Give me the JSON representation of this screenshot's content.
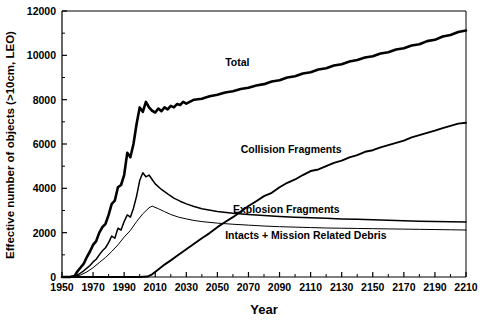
{
  "chart_data": {
    "type": "line",
    "title": "",
    "xlabel": "Year",
    "ylabel": "Effective number of objects (>10cm, LEO)",
    "xlim": [
      1950,
      2210
    ],
    "ylim": [
      0,
      12000
    ],
    "grid": false,
    "legend_position": "inline-annotations",
    "xticks": [
      1950,
      1970,
      1990,
      2010,
      2030,
      2050,
      2070,
      2090,
      2110,
      2130,
      2150,
      2170,
      2190,
      2210
    ],
    "xtick_labels": [
      "1950",
      "1970",
      "1990",
      "2010",
      "2030",
      "2050",
      "2070",
      "2090",
      "2110",
      "2130",
      "2150",
      "2170",
      "2190",
      "2210"
    ],
    "yticks": [
      0,
      2000,
      4000,
      6000,
      8000,
      10000,
      12000
    ],
    "ytick_labels": [
      "0",
      "2000",
      "4000",
      "6000",
      "8000",
      "10000",
      "12000"
    ],
    "yticks_minor": [
      1000,
      3000,
      5000,
      7000,
      9000,
      11000
    ],
    "series": [
      {
        "name": "Total",
        "label": "Total",
        "label_x": 2055,
        "label_y": 9500,
        "color": "#000000",
        "x": [
          1950,
          1955,
          1958,
          1960,
          1962,
          1964,
          1966,
          1968,
          1970,
          1972,
          1974,
          1976,
          1978,
          1980,
          1982,
          1984,
          1986,
          1988,
          1990,
          1992,
          1994,
          1996,
          1998,
          2000,
          2002,
          2004,
          2006,
          2008,
          2010,
          2012,
          2014,
          2016,
          2018,
          2020,
          2022,
          2024,
          2026,
          2028,
          2030,
          2035,
          2040,
          2045,
          2050,
          2055,
          2060,
          2065,
          2070,
          2075,
          2080,
          2085,
          2090,
          2095,
          2100,
          2105,
          2110,
          2115,
          2120,
          2125,
          2130,
          2135,
          2140,
          2145,
          2150,
          2155,
          2160,
          2165,
          2170,
          2175,
          2180,
          2185,
          2190,
          2195,
          2200,
          2205,
          2210
        ],
        "y": [
          0,
          0,
          40,
          260,
          430,
          600,
          900,
          1150,
          1450,
          1620,
          2000,
          2250,
          2400,
          2800,
          3300,
          3450,
          4050,
          4150,
          4600,
          5600,
          5400,
          6000,
          6900,
          7650,
          7450,
          7900,
          7650,
          7500,
          7420,
          7600,
          7480,
          7650,
          7560,
          7720,
          7650,
          7800,
          7760,
          7900,
          7820,
          8000,
          8040,
          8150,
          8220,
          8320,
          8380,
          8480,
          8540,
          8640,
          8700,
          8820,
          8880,
          9000,
          9060,
          9180,
          9240,
          9360,
          9420,
          9540,
          9600,
          9720,
          9790,
          9900,
          9960,
          10080,
          10140,
          10260,
          10320,
          10440,
          10500,
          10640,
          10700,
          10850,
          10920,
          11050,
          11120
        ]
      },
      {
        "name": "Collision Fragments",
        "label": "Collision Fragments",
        "label_x": 2065,
        "label_y": 5600,
        "color": "#000000",
        "x": [
          1950,
          1990,
          2000,
          2005,
          2008,
          2012,
          2016,
          2020,
          2025,
          2030,
          2035,
          2040,
          2045,
          2050,
          2055,
          2060,
          2065,
          2070,
          2075,
          2080,
          2085,
          2090,
          2095,
          2100,
          2105,
          2110,
          2115,
          2120,
          2125,
          2130,
          2135,
          2140,
          2145,
          2150,
          2155,
          2160,
          2165,
          2170,
          2175,
          2180,
          2185,
          2190,
          2195,
          2200,
          2205,
          2210
        ],
        "y": [
          0,
          0,
          0,
          20,
          120,
          340,
          560,
          750,
          1000,
          1250,
          1500,
          1750,
          1980,
          2250,
          2480,
          2700,
          2950,
          3200,
          3420,
          3650,
          3800,
          4050,
          4250,
          4400,
          4600,
          4780,
          4850,
          5000,
          5150,
          5250,
          5400,
          5500,
          5650,
          5720,
          5850,
          5950,
          6050,
          6150,
          6300,
          6400,
          6500,
          6600,
          6720,
          6820,
          6920,
          6960
        ]
      },
      {
        "name": "Explosion Fragments",
        "label": "Explosion Fragments",
        "label_x": 2060,
        "label_y": 2900,
        "color": "#000000",
        "x": [
          1950,
          1958,
          1960,
          1962,
          1964,
          1966,
          1968,
          1970,
          1972,
          1974,
          1976,
          1978,
          1980,
          1982,
          1984,
          1986,
          1988,
          1990,
          1992,
          1994,
          1996,
          1998,
          2000,
          2002,
          2004,
          2006,
          2008,
          2010,
          2014,
          2018,
          2022,
          2026,
          2030,
          2035,
          2040,
          2050,
          2060,
          2070,
          2080,
          2090,
          2100,
          2110,
          2120,
          2130,
          2140,
          2150,
          2160,
          2170,
          2180,
          2190,
          2200,
          2210
        ],
        "y": [
          0,
          20,
          80,
          180,
          280,
          400,
          520,
          680,
          800,
          1000,
          1180,
          1320,
          1550,
          1850,
          1750,
          2200,
          2120,
          2500,
          2800,
          2700,
          3100,
          3650,
          4350,
          4700,
          4520,
          4600,
          4400,
          4200,
          3950,
          3750,
          3560,
          3420,
          3300,
          3180,
          3080,
          2960,
          2880,
          2820,
          2770,
          2730,
          2700,
          2670,
          2650,
          2620,
          2600,
          2580,
          2560,
          2540,
          2520,
          2500,
          2490,
          2480
        ]
      },
      {
        "name": "Intacts + Mission Related Debris",
        "label": "Intacts + Mission Related Debris",
        "label_x": 2055,
        "label_y": 1700,
        "color": "#000000",
        "x": [
          1950,
          1958,
          1962,
          1966,
          1970,
          1974,
          1978,
          1982,
          1986,
          1990,
          1994,
          1998,
          2002,
          2006,
          2008,
          2012,
          2016,
          2020,
          2025,
          2030,
          2035,
          2040,
          2050,
          2060,
          2070,
          2080,
          2090,
          2100,
          2110,
          2120,
          2130,
          2140,
          2150,
          2160,
          2170,
          2180,
          2190,
          2200,
          2210
        ],
        "y": [
          0,
          10,
          90,
          230,
          420,
          650,
          880,
          1150,
          1450,
          1800,
          2100,
          2500,
          2850,
          3120,
          3200,
          3080,
          2950,
          2820,
          2700,
          2620,
          2550,
          2500,
          2430,
          2380,
          2340,
          2300,
          2270,
          2250,
          2230,
          2210,
          2200,
          2190,
          2180,
          2170,
          2160,
          2150,
          2140,
          2130,
          2120
        ]
      }
    ]
  }
}
